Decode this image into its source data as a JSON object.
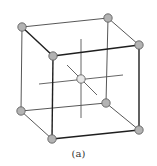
{
  "diagram": {
    "type": "body-centered-cubic-unit-cell",
    "caption": "(a)",
    "colors": {
      "edge": "#2a2a2a",
      "axis": "#555555",
      "corner_atom_fill": "#b3b3b3",
      "center_atom_fill": "#e6e6e6",
      "atom_stroke": "#555555"
    },
    "corner_atoms": [
      {
        "id": "back-top-left",
        "x": 22,
        "y": 27
      },
      {
        "id": "back-top-right",
        "x": 108,
        "y": 18
      },
      {
        "id": "front-top-left",
        "x": 53,
        "y": 56
      },
      {
        "id": "front-top-right",
        "x": 139,
        "y": 45
      },
      {
        "id": "back-bottom-left",
        "x": 21,
        "y": 111
      },
      {
        "id": "back-bottom-right",
        "x": 106,
        "y": 103
      },
      {
        "id": "front-bottom-left",
        "x": 52,
        "y": 139
      },
      {
        "id": "front-bottom-right",
        "x": 139,
        "y": 130
      }
    ],
    "center_atom": {
      "id": "body-center",
      "x": 81,
      "y": 79
    }
  }
}
